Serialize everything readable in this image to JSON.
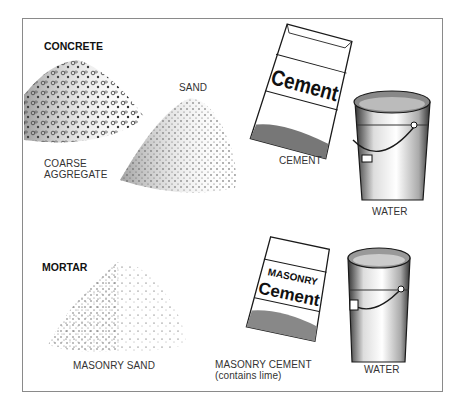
{
  "sections": [
    {
      "heading": "CONCRETE",
      "items": [
        {
          "label_lines": [
            "COARSE",
            "AGGREGATE"
          ],
          "icon": "gravel-pile-icon"
        },
        {
          "label_lines": [
            "SAND"
          ],
          "icon": "sand-pile-icon"
        },
        {
          "label_lines": [
            "CEMENT"
          ],
          "icon": "cement-bag-icon",
          "bag_text": [
            "Cement"
          ]
        },
        {
          "label_lines": [
            "WATER"
          ],
          "icon": "water-bucket-icon"
        }
      ]
    },
    {
      "heading": "MORTAR",
      "items": [
        {
          "label_lines": [
            "MASONRY SAND"
          ],
          "icon": "sand-pile-icon"
        },
        {
          "label_lines": [
            "MASONRY CEMENT",
            "(contains lime)"
          ],
          "icon": "cement-bag-icon",
          "bag_text": [
            "MASONRY",
            "Cement"
          ]
        },
        {
          "label_lines": [
            "WATER"
          ],
          "icon": "water-bucket-icon"
        }
      ]
    }
  ],
  "colors": {
    "ink": "#1a1a1a",
    "frame": "#8a8a8a",
    "background": "#ffffff"
  }
}
